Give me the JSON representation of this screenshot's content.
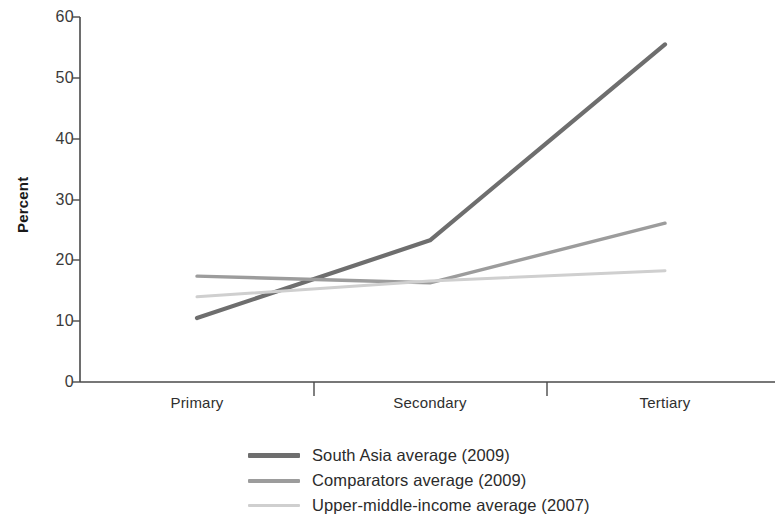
{
  "chart_data": {
    "type": "line",
    "title": "",
    "xlabel": "",
    "ylabel": "Percent",
    "categories": [
      "Primary",
      "Secondary",
      "Tertiary"
    ],
    "ylim": [
      0,
      60
    ],
    "yticks": [
      0,
      10,
      20,
      30,
      40,
      50,
      60
    ],
    "ytick_labels": [
      "0",
      "10",
      "20",
      "30",
      "40",
      "50",
      "60"
    ],
    "grid": false,
    "legend_position": "bottom-center",
    "series": [
      {
        "name": "South Asia average (2009)",
        "color": "#6e6e6e",
        "values": [
          10.5,
          23.3,
          55.5
        ]
      },
      {
        "name": "Comparators average (2009)",
        "color": "#9c9c9c",
        "values": [
          17.4,
          16.3,
          26.1
        ]
      },
      {
        "name": "Upper-middle-income average (2007)",
        "color": "#cfcfcf",
        "values": [
          14.0,
          16.6,
          18.3
        ]
      }
    ]
  },
  "axis": {
    "y_title": "Percent",
    "y_tick_0": "0",
    "y_tick_10": "10",
    "y_tick_20": "20",
    "y_tick_30": "30",
    "y_tick_40": "40",
    "y_tick_50": "50",
    "y_tick_60": "60",
    "x_tick_primary": "Primary",
    "x_tick_secondary": "Secondary",
    "x_tick_tertiary": "Tertiary"
  },
  "legend": {
    "items": [
      {
        "label": "South Asia average (2009)",
        "color": "#6e6e6e"
      },
      {
        "label": "Comparators average (2009)",
        "color": "#9c9c9c"
      },
      {
        "label": "Upper-middle-income average (2007)",
        "color": "#cfcfcf"
      }
    ]
  },
  "colors": {
    "axis": "#4a4a4a",
    "text": "#2b2b2b",
    "background": "#ffffff"
  }
}
